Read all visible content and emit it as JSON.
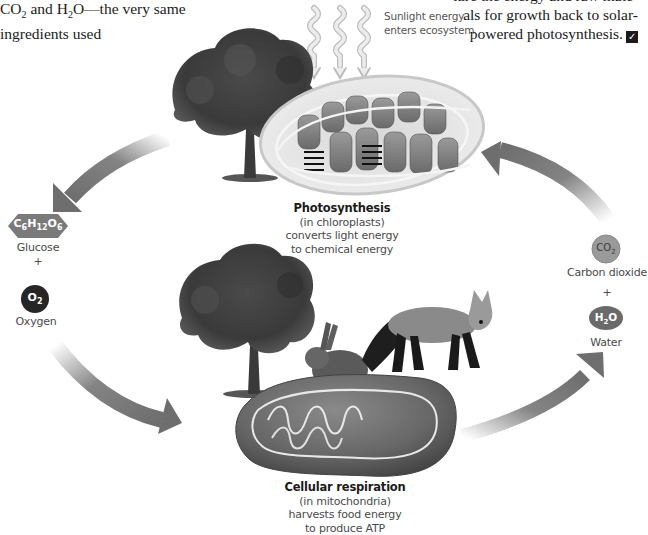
{
  "body_text": {
    "left_fragment": {
      "line1_pre": "CO",
      "line1_sub": "2",
      "line1_mid": " and H",
      "line1_sub2": "2",
      "line1_post": "O—the very same",
      "line2": "ingredients used"
    },
    "right_fragment": {
      "line1": "ture the energy and raw mate-",
      "line2": "als for growth back to solar-",
      "line3": "powered photosynthesis."
    },
    "checkpoint_icon": "checkbox-check-icon"
  },
  "sunlight": {
    "label_line1": "Sunlight energy",
    "label_line2": "enters ecosystem"
  },
  "photosynthesis": {
    "title": "Photosynthesis",
    "line1": "(in chloroplasts)",
    "line2": "converts light energy",
    "line3": "to chemical energy"
  },
  "respiration": {
    "title": "Cellular respiration",
    "line1": "(in mitochondria)",
    "line2": "harvests food energy",
    "line3": "to produce ATP"
  },
  "left_products": {
    "glucose_formula": {
      "C": "C",
      "c_sub": "6",
      "H": "H",
      "h_sub": "12",
      "O": "O",
      "o_sub": "6"
    },
    "glucose_label": "Glucose",
    "plus": "+",
    "oxygen_formula": {
      "O": "O",
      "o_sub": "2"
    },
    "oxygen_label": "Oxygen"
  },
  "right_products": {
    "co2_formula": {
      "C": "CO",
      "sub": "2"
    },
    "co2_label": "Carbon dioxide",
    "plus": "+",
    "h2o_formula": {
      "H": "H",
      "sub": "2",
      "O": "O"
    },
    "h2o_label": "Water"
  },
  "colors": {
    "arrow": "#6e6e6e",
    "glucose_badge": "#7a7a7a",
    "oxygen_badge": "#262626",
    "co2_badge": "#9a9a9a",
    "h2o_badge": "#6a6a6a",
    "text": "#1a1a1a",
    "label": "#4a4a4a"
  }
}
